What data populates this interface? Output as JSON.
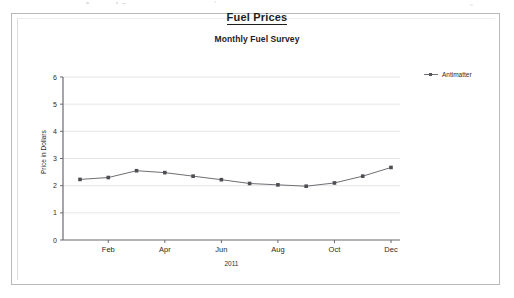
{
  "frame": {
    "label": "chart-document-frame"
  },
  "legend": {
    "position": "right-top",
    "entries": [
      {
        "label": "Antimatter",
        "color": "#6f6f75"
      }
    ]
  },
  "chart_data": {
    "type": "line",
    "title": "Fuel Prices",
    "subtitle": "Monthly Fuel Survey",
    "xlabel": "2011",
    "ylabel": "Price in Dollars",
    "categories": [
      "Jan",
      "Feb",
      "Mar",
      "Apr",
      "May",
      "Jun",
      "Jul",
      "Aug",
      "Sep",
      "Oct",
      "Nov",
      "Dec"
    ],
    "x_tick_labels": [
      "Feb",
      "Apr",
      "Jun",
      "Aug",
      "Oct",
      "Dec"
    ],
    "y_tick_labels": [
      "0",
      "1",
      "2",
      "3",
      "4",
      "5",
      "6"
    ],
    "ylim": [
      0,
      6
    ],
    "y_tick_step": 1,
    "grid": "horizontal",
    "marker": "square",
    "line_color": "#6f6f75",
    "marker_color": "#4d4d53",
    "series": [
      {
        "name": "Antimatter",
        "values": [
          2.23,
          2.3,
          2.55,
          2.48,
          2.35,
          2.22,
          2.08,
          2.03,
          1.98,
          2.1,
          2.35,
          2.67
        ]
      }
    ]
  }
}
